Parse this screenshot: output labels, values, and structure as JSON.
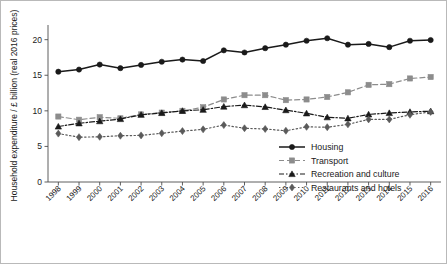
{
  "chart_data": {
    "type": "line",
    "title": "",
    "xlabel": "",
    "ylabel": "Household expenditure / £ billion (real 2016 prices)",
    "categories": [
      "1998",
      "1999",
      "2000",
      "2001",
      "2002",
      "2003",
      "2004",
      "2005",
      "2006",
      "2007",
      "2008",
      "2009",
      "2010",
      "2011",
      "2012",
      "2013",
      "2014",
      "2015",
      "2016"
    ],
    "x": [
      1998,
      1999,
      2000,
      2001,
      2002,
      2003,
      2004,
      2005,
      2006,
      2007,
      2008,
      2009,
      2010,
      2011,
      2012,
      2013,
      2014,
      2015,
      2016
    ],
    "xlim": [
      1997.5,
      2016.5
    ],
    "ylim": [
      0,
      21.5
    ],
    "yticks": [
      0,
      5,
      10,
      15,
      20
    ],
    "ytick_labels": [
      "0",
      "5",
      "10",
      "15",
      "20"
    ],
    "grid": false,
    "legend_position": "lower right",
    "series": [
      {
        "name": "Housing",
        "marker": "circle",
        "linestyle": "solid",
        "color": "#1a1a1a",
        "values": [
          15.5,
          15.8,
          16.5,
          16.0,
          16.45,
          16.9,
          17.2,
          17.0,
          18.5,
          18.2,
          18.8,
          19.3,
          19.85,
          20.2,
          19.3,
          19.4,
          18.95,
          19.85,
          19.95
        ]
      },
      {
        "name": "Transport",
        "marker": "square",
        "linestyle": "dashed",
        "color": "#8c8c8c",
        "values": [
          9.2,
          8.75,
          9.1,
          8.95,
          9.5,
          9.75,
          10.0,
          10.5,
          11.6,
          12.2,
          12.2,
          11.5,
          11.6,
          11.95,
          12.6,
          13.65,
          13.75,
          14.55,
          14.75
        ]
      },
      {
        "name": "Recreation and culture",
        "marker": "triangle",
        "linestyle": "dashdot",
        "color": "#1a1a1a",
        "values": [
          7.8,
          8.25,
          8.55,
          8.85,
          9.45,
          9.7,
          10.0,
          10.15,
          10.6,
          10.8,
          10.55,
          10.1,
          9.65,
          9.1,
          8.95,
          9.5,
          9.7,
          9.85,
          9.95
        ]
      },
      {
        "name": "Restaurants and hotels",
        "marker": "diamond",
        "linestyle": "dotted",
        "color": "#5a5a5a",
        "values": [
          6.8,
          6.3,
          6.35,
          6.5,
          6.55,
          6.85,
          7.15,
          7.4,
          8.0,
          7.55,
          7.45,
          7.2,
          7.75,
          7.7,
          8.1,
          8.8,
          8.8,
          9.45,
          9.85
        ]
      }
    ]
  },
  "legend": {
    "items": [
      {
        "label": "Housing"
      },
      {
        "label": "Transport"
      },
      {
        "label": "Recreation and culture"
      },
      {
        "label": "Restaurants and hotels"
      }
    ]
  }
}
